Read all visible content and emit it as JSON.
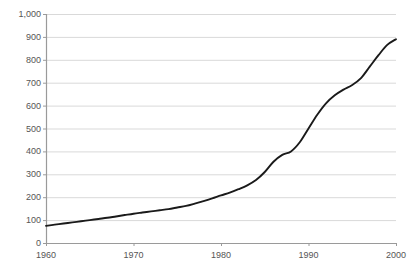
{
  "chart_data": {
    "type": "line",
    "title": "",
    "xlabel": "",
    "ylabel": "",
    "xlim": [
      1960,
      2000
    ],
    "ylim": [
      0,
      1000
    ],
    "grid": true,
    "legend": "none",
    "series_color": "#1a1a1a",
    "gridline_color": "#d9d9d9",
    "axis_color": "#9a9a9a",
    "y_ticks": [
      "0",
      "100",
      "200",
      "300",
      "400",
      "500",
      "600",
      "700",
      "800",
      "900",
      "1,000"
    ],
    "y_tick_values": [
      0,
      100,
      200,
      300,
      400,
      500,
      600,
      700,
      800,
      900,
      1000
    ],
    "x_ticks": [
      "1960",
      "1970",
      "1980",
      "1990",
      "2000"
    ],
    "x_tick_values": [
      1960,
      1970,
      1980,
      1990,
      2000
    ],
    "x": [
      1960,
      1961,
      1962,
      1963,
      1964,
      1965,
      1966,
      1967,
      1968,
      1969,
      1970,
      1971,
      1972,
      1973,
      1974,
      1975,
      1976,
      1977,
      1978,
      1979,
      1980,
      1981,
      1982,
      1983,
      1984,
      1985,
      1986,
      1987,
      1988,
      1989,
      1990,
      1991,
      1992,
      1993,
      1994,
      1995,
      1996,
      1997,
      1998,
      1999,
      2000
    ],
    "values": [
      75,
      80,
      85,
      90,
      95,
      100,
      105,
      110,
      116,
      122,
      128,
      133,
      138,
      143,
      148,
      155,
      162,
      172,
      183,
      195,
      208,
      220,
      235,
      252,
      275,
      310,
      355,
      385,
      400,
      440,
      500,
      560,
      610,
      645,
      670,
      690,
      720,
      770,
      820,
      865,
      890
    ],
    "series": [
      {
        "name": "series-1",
        "values": [
          75,
          80,
          85,
          90,
          95,
          100,
          105,
          110,
          116,
          122,
          128,
          133,
          138,
          143,
          148,
          155,
          162,
          172,
          183,
          195,
          208,
          220,
          235,
          252,
          275,
          310,
          355,
          385,
          400,
          440,
          500,
          560,
          610,
          645,
          670,
          690,
          720,
          770,
          820,
          865,
          890
        ]
      }
    ]
  },
  "layout": {
    "plot_left": 46,
    "plot_right": 396,
    "plot_top": 14,
    "plot_bottom": 243
  }
}
